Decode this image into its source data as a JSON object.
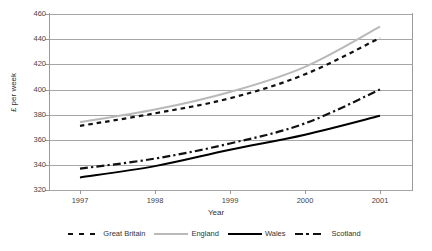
{
  "chart_data": {
    "type": "line",
    "title": "",
    "xlabel": "Year",
    "ylabel": "£ per week",
    "categories": [
      "1997",
      "1998",
      "1999",
      "2000",
      "2001"
    ],
    "x": [
      1997,
      1998,
      1999,
      2000,
      2001
    ],
    "xlim": [
      1997,
      2001
    ],
    "ylim": [
      320,
      460
    ],
    "yticks": [
      460,
      440,
      420,
      400,
      380,
      360,
      340,
      320
    ],
    "xticks": [
      "1997",
      "1998",
      "1999",
      "2000",
      "2001"
    ],
    "grid": true,
    "legend_position": "bottom",
    "series": [
      {
        "name": "Great Britain",
        "style": "dotted",
        "color": "#111111",
        "values": [
          371,
          381,
          393,
          412,
          441
        ]
      },
      {
        "name": "England",
        "style": "solid",
        "color": "#b9b9b9",
        "values": [
          374,
          384,
          398,
          418,
          450
        ]
      },
      {
        "name": "Wales",
        "style": "solid",
        "color": "#000000",
        "values": [
          330,
          339,
          352,
          364,
          379
        ]
      },
      {
        "name": "Scotland",
        "style": "dash-dot",
        "color": "#111111",
        "values": [
          337,
          345,
          357,
          373,
          400
        ]
      }
    ]
  },
  "axes": {
    "y_label": "£ per week",
    "x_label": "Year",
    "y_tick_labels": [
      "460",
      "440",
      "420",
      "400",
      "380",
      "360",
      "340",
      "320"
    ],
    "x_tick_labels": [
      "1997",
      "1998",
      "1999",
      "2000",
      "2001"
    ]
  },
  "legend": {
    "items": [
      {
        "label": "Great Britain"
      },
      {
        "label": "England"
      },
      {
        "label": "Wales"
      },
      {
        "label": "Scotland"
      }
    ]
  }
}
